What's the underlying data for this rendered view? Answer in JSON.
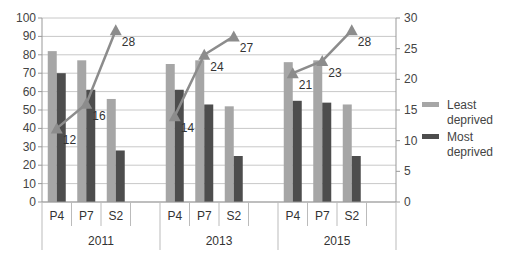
{
  "chart_data": {
    "type": "bar+line",
    "groups": [
      "2011",
      "2013",
      "2015"
    ],
    "categories": [
      [
        "P4",
        "P7",
        "S2"
      ],
      [
        "P4",
        "P7",
        "S2"
      ],
      [
        "P4",
        "P7",
        "S2"
      ]
    ],
    "series": [
      {
        "name": "Least deprived",
        "type": "bar",
        "axis": "left",
        "color": "#a6a6a6",
        "values": [
          [
            82,
            77,
            56
          ],
          [
            75,
            77,
            52
          ],
          [
            76,
            77,
            53
          ]
        ]
      },
      {
        "name": "Most deprived",
        "type": "bar",
        "axis": "left",
        "color": "#4d4d4d",
        "values": [
          [
            70,
            61,
            28
          ],
          [
            61,
            53,
            25
          ],
          [
            55,
            54,
            25
          ]
        ]
      },
      {
        "name": "Gap",
        "type": "line",
        "axis": "right",
        "color": "#8c8c8c",
        "values": [
          [
            12,
            16,
            28
          ],
          [
            14,
            24,
            27
          ],
          [
            21,
            23,
            28
          ]
        ],
        "data_labels": [
          [
            "12",
            "16",
            "28"
          ],
          [
            "14",
            "24",
            "27"
          ],
          [
            "21",
            "23",
            "28"
          ]
        ]
      }
    ],
    "left_axis": {
      "min": 0,
      "max": 100,
      "step": 10,
      "ticks": [
        "0",
        "10",
        "20",
        "30",
        "40",
        "50",
        "60",
        "70",
        "80",
        "90",
        "100"
      ]
    },
    "right_axis": {
      "min": 0,
      "max": 30,
      "step": 5,
      "ticks": [
        "0",
        "5",
        "10",
        "15",
        "20",
        "25",
        "30"
      ]
    },
    "grid": true,
    "legend": {
      "position": "right",
      "entries": [
        {
          "label_line1": "Least",
          "label_line2": "deprived",
          "color": "#a6a6a6"
        },
        {
          "label_line1": "Most",
          "label_line2": "deprived",
          "color": "#4d4d4d"
        }
      ]
    },
    "title": "",
    "xlabel": "",
    "ylabel": ""
  }
}
